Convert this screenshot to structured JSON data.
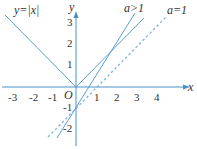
{
  "figure": {
    "curve_label": "y=|x|",
    "line_a_gt_1_label": "a>1",
    "line_a_eq_1_label": "a=1",
    "x_axis_label": "x",
    "y_axis_label": "y",
    "origin_label": "O",
    "x_ticks": [
      "-3",
      "-2",
      "-1",
      "1",
      "2",
      "3",
      "4"
    ],
    "y_ticks": [
      "3",
      "2",
      "1",
      "-1",
      "-2"
    ],
    "colors": {
      "axis": "#4a90c8",
      "line": "#5a9fd4",
      "dashed": "#7fb3e0",
      "text": "#333333"
    }
  }
}
